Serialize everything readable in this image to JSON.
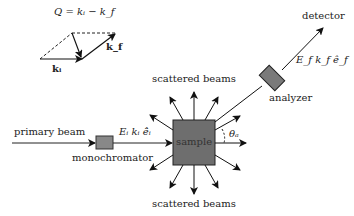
{
  "vector_diagram": {
    "equation": "Q = kᵢ − k_f",
    "ki_label": "kᵢ",
    "kf_label": "k_f"
  },
  "labels": {
    "primary_beam": "primary beam",
    "monochromator": "monochromator",
    "incident_params": "Eᵢ  kᵢ  ê̂ᵢ",
    "sample": "sample",
    "scattered_top": "scattered beams",
    "scattered_bottom": "scattered beams",
    "analyzer": "analyzer",
    "final_params": "E_f  k_f  ê_f",
    "detector": "detector",
    "theta": "θₐ"
  }
}
